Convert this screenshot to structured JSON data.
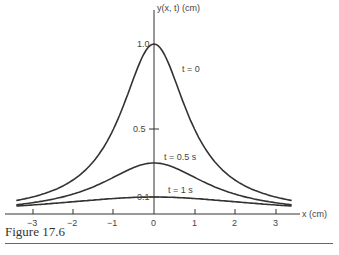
{
  "figure": {
    "caption": "Figure 17.6",
    "ylabel": "y(x, t) (cm)",
    "xlabel": "x (cm)"
  },
  "chart_data": {
    "type": "line",
    "title": "",
    "xlabel": "x (cm)",
    "ylabel": "y(x, t) (cm)",
    "xlim": [
      -3.4,
      3.4
    ],
    "ylim": [
      0,
      1.1
    ],
    "x_ticks": [
      "-3",
      "-2",
      "-1",
      "0",
      "1",
      "2",
      "3"
    ],
    "y_ticks": [
      "0.1",
      "0.5",
      "1.0"
    ],
    "grid": false,
    "legend": "inline curve labels",
    "x": [
      -3.4,
      -3,
      -2,
      -1,
      0,
      1,
      2,
      3,
      3.4
    ],
    "series": [
      {
        "name": "t = 0",
        "values": [
          0.08,
          0.1,
          0.2,
          0.5,
          1.0,
          0.5,
          0.2,
          0.1,
          0.08
        ]
      },
      {
        "name": "t = 0.5 s",
        "values": [
          0.06,
          0.07,
          0.12,
          0.22,
          0.3,
          0.22,
          0.12,
          0.07,
          0.06
        ]
      },
      {
        "name": "t = 1 s",
        "values": [
          0.04,
          0.05,
          0.07,
          0.09,
          0.1,
          0.09,
          0.07,
          0.05,
          0.04
        ]
      }
    ]
  },
  "labels": {
    "y_tick_1": "1.0",
    "y_tick_05": "0.5",
    "y_tick_01": "0.1",
    "x_ticks": [
      "−3",
      "−2",
      "−1",
      "0",
      "1",
      "2",
      "3"
    ],
    "curve_t0": "t = 0",
    "curve_t05": "t = 0.5 s",
    "curve_t1": "t = 1 s"
  }
}
